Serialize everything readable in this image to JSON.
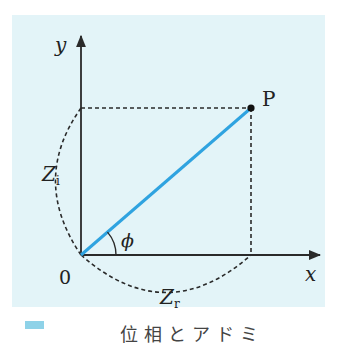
{
  "figure": {
    "panel_color": "#e3f4f8",
    "axis_color": "#2a2a2a",
    "vector_color": "#2fa3e0",
    "dash_color": "#2a2a2a",
    "labels": {
      "x_axis": "x",
      "y_axis": "y",
      "origin": "0",
      "point": "P",
      "angle": "ϕ",
      "imag_main": "Z",
      "imag_sub": "i",
      "real_main": "Z",
      "real_sub": "r"
    }
  },
  "caption": {
    "marker_color": "#8ed2e8",
    "text": "位相とアドミ"
  }
}
